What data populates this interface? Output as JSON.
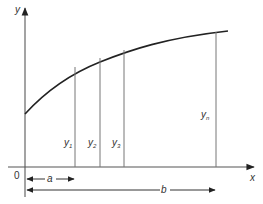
{
  "diagram": {
    "type": "area-under-curve",
    "axes": {
      "x_label": "x",
      "y_label": "y",
      "origin_label": "0"
    },
    "ordinates": [
      {
        "label": "y",
        "sub": "1"
      },
      {
        "label": "y",
        "sub": "2"
      },
      {
        "label": "y",
        "sub": "3"
      },
      {
        "label": "y",
        "sub": "n"
      }
    ],
    "dimensions": {
      "a_label": "a",
      "b_label": "b"
    },
    "colors": {
      "curve": "#222222",
      "axis": "#555555",
      "ordinate": "#777777"
    }
  }
}
